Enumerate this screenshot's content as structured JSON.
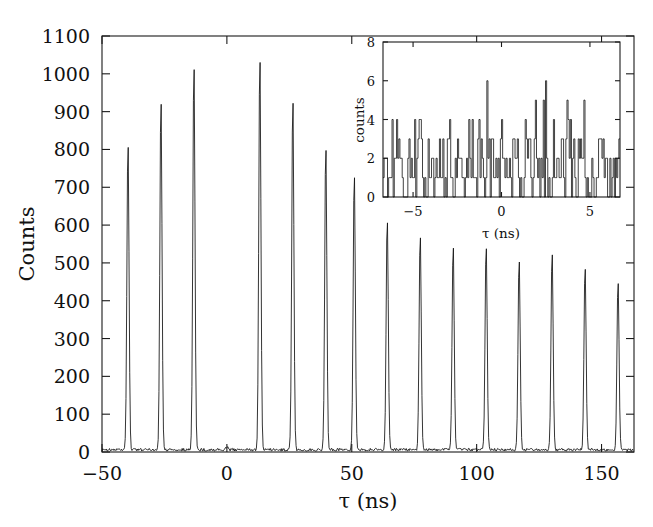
{
  "chart_data": {
    "type": "line",
    "title": "",
    "xlabel": "τ (ns)",
    "ylabel": "Counts",
    "xlim": [
      -50,
      163
    ],
    "ylim": [
      0,
      1100
    ],
    "grid": false,
    "legend": "none",
    "x_ticks": [
      -50,
      0,
      50,
      100,
      150
    ],
    "x_tick_labels": [
      "−50",
      "0",
      "50",
      "100",
      "150"
    ],
    "y_ticks": [
      0,
      100,
      200,
      300,
      400,
      500,
      600,
      700,
      800,
      900,
      1000,
      1100
    ],
    "y_tick_labels": [
      "0",
      "100",
      "200",
      "300",
      "400",
      "500",
      "600",
      "700",
      "800",
      "900",
      "1000",
      "1100"
    ],
    "y_major_labels": [
      "0",
      "100",
      "200",
      "300",
      "400",
      "500",
      "600",
      "700",
      "800",
      "900",
      "1000",
      "1100"
    ],
    "baseline_counts": 6,
    "peaks": [
      {
        "x": -39.6,
        "height": 822
      },
      {
        "x": -26.4,
        "height": 939
      },
      {
        "x": -13.2,
        "height": 1037
      },
      {
        "x": 0.0,
        "height": 8
      },
      {
        "x": 13.2,
        "height": 1052
      },
      {
        "x": 26.4,
        "height": 939
      },
      {
        "x": 39.6,
        "height": 812
      },
      {
        "x": 51.0,
        "height": 740
      },
      {
        "x": 64.2,
        "height": 621
      },
      {
        "x": 77.4,
        "height": 580
      },
      {
        "x": 90.6,
        "height": 545
      },
      {
        "x": 103.8,
        "height": 548
      },
      {
        "x": 117.0,
        "height": 512
      },
      {
        "x": 130.2,
        "height": 533
      },
      {
        "x": 143.4,
        "height": 489
      },
      {
        "x": 156.6,
        "height": 452
      }
    ],
    "inset": {
      "type": "line",
      "xlabel": "τ (ns)",
      "ylabel": "counts",
      "xlim": [
        -6.7,
        6.7
      ],
      "ylim": [
        0,
        8
      ],
      "x_ticks": [
        -5,
        0,
        5
      ],
      "x_tick_labels": [
        "−5",
        "0",
        "5"
      ],
      "y_ticks": [
        0,
        2,
        4,
        6,
        8
      ],
      "y_tick_labels": [
        "0",
        "2",
        "4",
        "6",
        "8"
      ],
      "description": "Zoom of the zero-delay region showing only shot-noise level counts (0-6), confirming the missing central peak.",
      "mean_counts": 1.8,
      "max_counts": 6
    }
  }
}
